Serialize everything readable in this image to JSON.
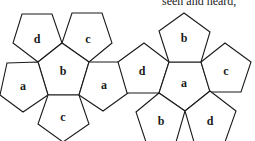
{
  "caption": "seen and heard,",
  "diagram": {
    "type": "dodecahedron-net",
    "stroke_color": "#1a1a1a",
    "background": "#ffffff",
    "faces": [
      {
        "id": "left-d",
        "label": "d",
        "points": [
          [
            22,
            14
          ],
          [
            52,
            14
          ],
          [
            62,
            43
          ],
          [
            38,
            62
          ],
          [
            13,
            43
          ]
        ],
        "label_pos": [
          37,
          40
        ]
      },
      {
        "id": "left-c-top",
        "label": "c",
        "points": [
          [
            72,
            13
          ],
          [
            102,
            13
          ],
          [
            112,
            43
          ],
          [
            89,
            62
          ],
          [
            62,
            43
          ]
        ],
        "label_pos": [
          88,
          40
        ]
      },
      {
        "id": "left-b-center",
        "label": "b",
        "points": [
          [
            62,
            43
          ],
          [
            89,
            62
          ],
          [
            79,
            95
          ],
          [
            48,
            95
          ],
          [
            38,
            62
          ]
        ],
        "label_pos": [
          63,
          72
        ]
      },
      {
        "id": "left-a",
        "label": "a",
        "points": [
          [
            7,
            63
          ],
          [
            38,
            62
          ],
          [
            48,
            95
          ],
          [
            23,
            112
          ],
          [
            0,
            95
          ]
        ],
        "label_pos": [
          23,
          87
        ]
      },
      {
        "id": "left-c-bottom",
        "label": "c",
        "points": [
          [
            48,
            95
          ],
          [
            79,
            95
          ],
          [
            89,
            124
          ],
          [
            63,
            142
          ],
          [
            38,
            124
          ]
        ],
        "label_pos": [
          63,
          118
        ]
      },
      {
        "id": "mid-a",
        "label": "a",
        "points": [
          [
            89,
            62
          ],
          [
            120,
            62
          ],
          [
            128,
            93
          ],
          [
            103,
            111
          ],
          [
            79,
            95
          ]
        ],
        "label_pos": [
          104,
          86
        ]
      },
      {
        "id": "mid-d",
        "label": "d",
        "points": [
          [
            118,
            62
          ],
          [
            144,
            43
          ],
          [
            169,
            62
          ],
          [
            159,
            93
          ],
          [
            127,
            93
          ]
        ],
        "label_pos": [
          142,
          72
        ]
      },
      {
        "id": "right-a-center",
        "label": "a",
        "points": [
          [
            169,
            62
          ],
          [
            201,
            62
          ],
          [
            210,
            91
          ],
          [
            185,
            111
          ],
          [
            159,
            93
          ]
        ],
        "label_pos": [
          184,
          84
        ]
      },
      {
        "id": "right-b-top",
        "label": "b",
        "points": [
          [
            169,
            62
          ],
          [
            159,
            31
          ],
          [
            184,
            13
          ],
          [
            210,
            32
          ],
          [
            201,
            62
          ]
        ],
        "label_pos": [
          184,
          39
        ]
      },
      {
        "id": "right-c",
        "label": "c",
        "points": [
          [
            201,
            62
          ],
          [
            225,
            43
          ],
          [
            251,
            62
          ],
          [
            241,
            92
          ],
          [
            210,
            92
          ]
        ],
        "label_pos": [
          226,
          72
        ]
      },
      {
        "id": "right-b-bottom",
        "label": "b",
        "points": [
          [
            159,
            93
          ],
          [
            185,
            111
          ],
          [
            176,
            142
          ],
          [
            146,
            142
          ],
          [
            136,
            112
          ]
        ],
        "label_pos": [
          161,
          122
        ]
      },
      {
        "id": "right-d-bottom",
        "label": "d",
        "points": [
          [
            185,
            111
          ],
          [
            210,
            91
          ],
          [
            236,
            111
          ],
          [
            225,
            142
          ],
          [
            194,
            142
          ]
        ],
        "label_pos": [
          210,
          122
        ]
      }
    ]
  }
}
